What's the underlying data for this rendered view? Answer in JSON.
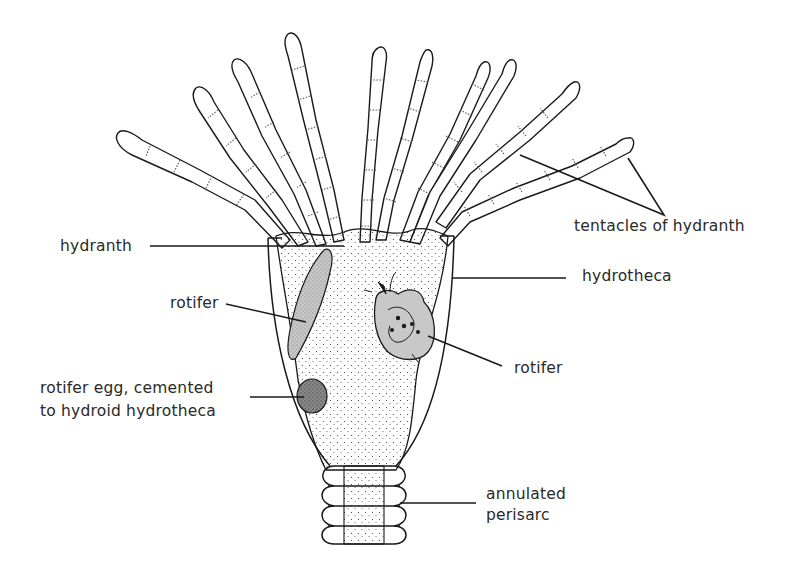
{
  "diagram": {
    "labels": {
      "hydranth": "hydranth",
      "rotifer_left": "rotifer",
      "rotifer_egg_line1": "rotifer egg, cemented",
      "rotifer_egg_line2": "to hydroid hydrotheca",
      "tentacles": "tentacles of hydranth",
      "hydrotheca": "hydrotheca",
      "rotifer_right": "rotifer",
      "perisarc_line1": "annulated",
      "perisarc_line2": "perisarc"
    },
    "tentacle_count": 10,
    "annulation_count": 4,
    "colors": {
      "ink": "#1a1a1a",
      "label_text": "#2a2a2a",
      "rotifer_fill": "#c8c8c8",
      "background": "#ffffff"
    }
  }
}
